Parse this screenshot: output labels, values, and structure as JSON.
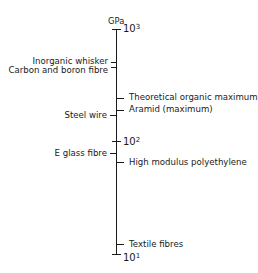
{
  "diagram": {
    "unit": "GPa",
    "scale": "log",
    "decades": [
      {
        "base": "10",
        "power": "3"
      },
      {
        "base": "10",
        "power": "2"
      },
      {
        "base": "10",
        "power": "1"
      }
    ],
    "left_labels": [
      {
        "text": "Inorganic whisker"
      },
      {
        "text": "Carbon and boron fibre"
      },
      {
        "text": "Steel wire"
      },
      {
        "text": "E glass fibre"
      }
    ],
    "right_labels": [
      {
        "text": "Theoretical organic maximum"
      },
      {
        "text": "Aramid (maximum)"
      },
      {
        "text": "High modulus polyethylene"
      },
      {
        "text": "Textile fibres"
      }
    ]
  }
}
